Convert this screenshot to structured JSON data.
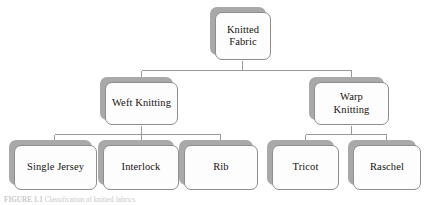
{
  "figure": {
    "caption_label": "FIGURE 1.1",
    "caption_text": "Classification of knitted fabrics.",
    "colors": {
      "shadow": "#a9a9a9",
      "card_fill": "#fdfdfd",
      "card_border": "#8d8d8d",
      "connector": "#9a9a9a",
      "text": "#16130f"
    }
  },
  "tree": {
    "root": {
      "label": "Knitted\nFabric"
    },
    "level2": [
      {
        "label": "Weft Knitting"
      },
      {
        "label": "Warp\nKnitting"
      }
    ],
    "weft_children": [
      {
        "label": "Single Jersey"
      },
      {
        "label": "Interlock"
      },
      {
        "label": "Rib"
      }
    ],
    "warp_children": [
      {
        "label": "Tricot"
      },
      {
        "label": "Raschel"
      }
    ]
  }
}
